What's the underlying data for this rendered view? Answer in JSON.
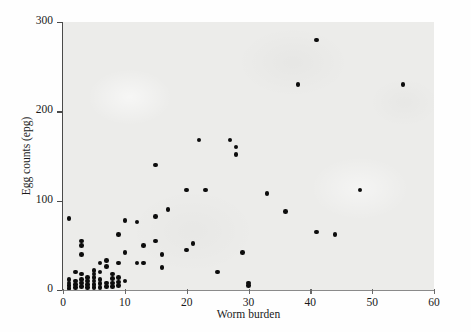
{
  "chart_data": {
    "type": "scatter",
    "title": "",
    "xlabel": "Worm burden",
    "ylabel": "Egg counts (epg)",
    "xlim": [
      0,
      60
    ],
    "ylim": [
      0,
      300
    ],
    "xticks": [
      0,
      10,
      20,
      30,
      40,
      50,
      60
    ],
    "yticks": [
      0,
      100,
      200,
      300
    ],
    "grid": false,
    "legend": null,
    "marker": "filled-circle",
    "marker_color": "#0d0d0d",
    "panel_color": "#ececea",
    "points": [
      [
        1,
        80
      ],
      [
        1,
        12
      ],
      [
        1,
        8
      ],
      [
        1,
        5
      ],
      [
        1,
        2
      ],
      [
        2,
        20
      ],
      [
        2,
        10
      ],
      [
        2,
        6
      ],
      [
        2,
        3
      ],
      [
        3,
        55
      ],
      [
        3,
        50
      ],
      [
        3,
        40
      ],
      [
        3,
        18
      ],
      [
        3,
        12
      ],
      [
        3,
        8
      ],
      [
        3,
        4
      ],
      [
        4,
        14
      ],
      [
        4,
        10
      ],
      [
        4,
        6
      ],
      [
        4,
        3
      ],
      [
        5,
        22
      ],
      [
        5,
        18
      ],
      [
        5,
        14
      ],
      [
        5,
        10
      ],
      [
        5,
        6
      ],
      [
        5,
        3
      ],
      [
        6,
        30
      ],
      [
        6,
        20
      ],
      [
        6,
        12
      ],
      [
        6,
        7
      ],
      [
        6,
        3
      ],
      [
        7,
        33
      ],
      [
        7,
        26
      ],
      [
        7,
        8
      ],
      [
        7,
        4
      ],
      [
        8,
        18
      ],
      [
        8,
        13
      ],
      [
        8,
        8
      ],
      [
        8,
        4
      ],
      [
        9,
        62
      ],
      [
        9,
        30
      ],
      [
        9,
        14
      ],
      [
        9,
        9
      ],
      [
        9,
        5
      ],
      [
        10,
        78
      ],
      [
        10,
        42
      ],
      [
        10,
        10
      ],
      [
        12,
        76
      ],
      [
        12,
        30
      ],
      [
        13,
        50
      ],
      [
        13,
        30
      ],
      [
        15,
        140
      ],
      [
        15,
        82
      ],
      [
        15,
        55
      ],
      [
        16,
        40
      ],
      [
        16,
        25
      ],
      [
        17,
        90
      ],
      [
        20,
        112
      ],
      [
        20,
        45
      ],
      [
        21,
        52
      ],
      [
        22,
        168
      ],
      [
        23,
        112
      ],
      [
        25,
        20
      ],
      [
        27,
        168
      ],
      [
        28,
        160
      ],
      [
        28,
        152
      ],
      [
        29,
        42
      ],
      [
        30,
        8
      ],
      [
        30,
        5
      ],
      [
        33,
        108
      ],
      [
        36,
        88
      ],
      [
        38,
        230
      ],
      [
        41,
        280
      ],
      [
        41,
        65
      ],
      [
        44,
        62
      ],
      [
        48,
        112
      ],
      [
        55,
        230
      ]
    ]
  },
  "axes": {
    "x_tick_labels": [
      "0",
      "10",
      "20",
      "30",
      "40",
      "50",
      "60"
    ],
    "y_tick_labels": [
      "0",
      "100",
      "200",
      "300"
    ]
  }
}
